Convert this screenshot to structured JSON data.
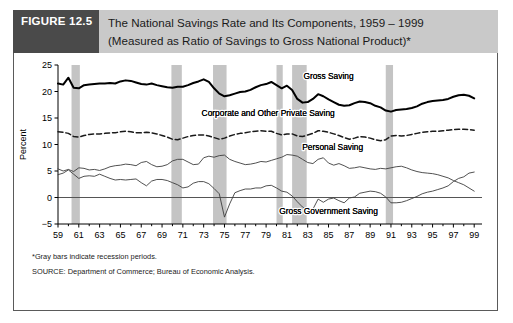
{
  "figure": {
    "tag": "FIGURE 12.5",
    "title_line1": "The National Savings Rate and Its Components, 1959 – 1999",
    "title_line2": "(Measured as Ratio of Savings to Gross National Product)*",
    "note_star": "*Gray bars indicate recession periods.",
    "note_source": "SOURCE: Department of Commerce; Bureau of Economic Analysis.",
    "colors": {
      "tag_background": "#4a4a4a",
      "tag_text": "#ffffff",
      "title_background": "#c9c9c9",
      "border": "#5a5a5a",
      "recession_bar": "#c4c4c4",
      "gross_saving_line": "#000000",
      "thin_line": "#4d4d4d"
    }
  },
  "chart_data": {
    "type": "line",
    "title": "The National Savings Rate and Its Components, 1959 – 1999",
    "xlabel": "",
    "ylabel": "Percent",
    "xlim": [
      1959,
      1999.75
    ],
    "ylim": [
      -5,
      25
    ],
    "yticks": [
      -5,
      0,
      5,
      10,
      15,
      20,
      25
    ],
    "xticks": [
      59,
      61,
      63,
      65,
      67,
      69,
      71,
      73,
      75,
      77,
      79,
      81,
      83,
      85,
      87,
      89,
      91,
      93,
      95,
      97,
      99
    ],
    "xtick_labels": [
      "59",
      "61",
      "63",
      "65",
      "67",
      "69",
      "71",
      "73",
      "75",
      "77",
      "79",
      "81",
      "83",
      "85",
      "87",
      "89",
      "91",
      "93",
      "95",
      "97",
      "99"
    ],
    "grid": false,
    "legend_position": "inline-annotations",
    "zero_line": 0,
    "recession_bands": [
      {
        "start": 1960.3,
        "end": 1961.1
      },
      {
        "start": 1969.9,
        "end": 1970.9
      },
      {
        "start": 1973.9,
        "end": 1975.2
      },
      {
        "start": 1980.0,
        "end": 1980.6
      },
      {
        "start": 1981.5,
        "end": 1982.9
      },
      {
        "start": 1990.5,
        "end": 1991.2
      }
    ],
    "annotations": [
      {
        "text": "Gross Saving",
        "x": 1985.0,
        "y": 22.3
      },
      {
        "text": "Corporate and Other Private Saving",
        "x": 1979.2,
        "y": 15.4
      },
      {
        "text": "Personal Saving",
        "x": 1985.4,
        "y": 8.9
      },
      {
        "text": "Gross Government Saving",
        "x": 1985.0,
        "y": -3.2
      }
    ],
    "x": [
      1959,
      1959.5,
      1960,
      1960.5,
      1961,
      1961.5,
      1962,
      1962.5,
      1963,
      1963.5,
      1964,
      1964.5,
      1965,
      1965.5,
      1966,
      1966.5,
      1967,
      1967.5,
      1968,
      1968.5,
      1969,
      1969.5,
      1970,
      1970.5,
      1971,
      1971.5,
      1972,
      1972.5,
      1973,
      1973.5,
      1974,
      1974.5,
      1975,
      1975.5,
      1976,
      1976.5,
      1977,
      1977.5,
      1978,
      1978.5,
      1979,
      1979.5,
      1980,
      1980.5,
      1981,
      1981.5,
      1982,
      1982.5,
      1983,
      1983.5,
      1984,
      1984.5,
      1985,
      1985.5,
      1986,
      1986.5,
      1987,
      1987.5,
      1988,
      1988.5,
      1989,
      1989.5,
      1990,
      1990.5,
      1991,
      1991.5,
      1992,
      1992.5,
      1993,
      1993.5,
      1994,
      1994.5,
      1995,
      1995.5,
      1996,
      1996.5,
      1997,
      1997.5,
      1998,
      1998.5,
      1999
    ],
    "series": [
      {
        "name": "Gross Saving",
        "style": "solid-thick",
        "values": [
          21.5,
          21.3,
          22.6,
          20.7,
          20.6,
          21.2,
          21.3,
          21.4,
          21.5,
          21.5,
          21.6,
          21.5,
          21.9,
          22.1,
          22.0,
          21.7,
          21.4,
          21.3,
          21.5,
          21.2,
          21.0,
          20.8,
          20.7,
          20.9,
          20.9,
          21.2,
          21.6,
          21.9,
          22.3,
          21.8,
          20.6,
          19.6,
          19.1,
          19.3,
          19.6,
          19.9,
          20.0,
          20.3,
          20.8,
          21.2,
          21.4,
          21.8,
          21.2,
          20.6,
          21.1,
          20.3,
          18.6,
          17.9,
          18.0,
          18.6,
          19.5,
          19.1,
          18.5,
          18.0,
          17.5,
          17.3,
          17.4,
          17.8,
          18.1,
          18.0,
          17.8,
          17.3,
          17.0,
          16.4,
          16.2,
          16.5,
          16.6,
          16.7,
          16.9,
          17.2,
          17.7,
          18.0,
          18.2,
          18.3,
          18.4,
          18.6,
          19.0,
          19.3,
          19.4,
          19.2,
          18.7
        ],
        "description": "Total gross national saving, thick black line"
      },
      {
        "name": "Corporate and Other Private Saving",
        "style": "dashed",
        "values": [
          12.4,
          12.3,
          12.1,
          11.5,
          11.4,
          11.7,
          11.9,
          12.0,
          12.0,
          12.1,
          12.2,
          12.2,
          12.4,
          12.5,
          12.4,
          12.2,
          12.2,
          12.3,
          12.2,
          12.0,
          11.7,
          11.4,
          11.0,
          10.9,
          11.2,
          11.5,
          11.7,
          11.8,
          11.8,
          11.6,
          11.3,
          11.0,
          11.2,
          11.6,
          11.9,
          12.1,
          12.2,
          12.4,
          12.5,
          12.6,
          12.5,
          12.5,
          12.1,
          11.8,
          12.0,
          12.0,
          11.6,
          11.5,
          11.8,
          12.1,
          12.6,
          12.5,
          12.3,
          12.0,
          11.7,
          11.3,
          11.0,
          11.2,
          11.5,
          11.4,
          11.2,
          10.9,
          10.7,
          10.9,
          11.6,
          11.7,
          11.6,
          11.7,
          11.9,
          12.1,
          12.3,
          12.4,
          12.5,
          12.5,
          12.6,
          12.7,
          12.8,
          12.9,
          12.9,
          12.8,
          12.7
        ],
        "description": "Corporate and other private saving, dashed line"
      },
      {
        "name": "Personal Saving",
        "style": "solid-thin",
        "values": [
          5.4,
          5.0,
          5.3,
          4.9,
          5.6,
          5.5,
          5.2,
          5.3,
          5.1,
          5.4,
          5.8,
          6.0,
          6.1,
          6.3,
          6.2,
          6.0,
          6.6,
          6.8,
          6.2,
          5.8,
          5.9,
          6.2,
          6.9,
          7.2,
          7.2,
          6.7,
          6.2,
          6.3,
          7.5,
          7.8,
          7.6,
          7.9,
          8.0,
          7.2,
          6.8,
          6.5,
          6.2,
          6.3,
          6.5,
          6.8,
          6.7,
          7.0,
          7.3,
          7.6,
          8.1,
          8.0,
          7.8,
          7.2,
          6.6,
          6.4,
          7.2,
          7.5,
          6.5,
          6.1,
          6.4,
          6.0,
          5.5,
          5.6,
          5.8,
          5.6,
          5.4,
          5.3,
          5.5,
          5.4,
          5.6,
          5.8,
          5.9,
          5.6,
          5.2,
          4.9,
          4.7,
          4.6,
          4.5,
          4.3,
          4.0,
          3.7,
          3.2,
          2.8,
          2.4,
          1.8,
          1.2
        ],
        "description": "Personal saving, thin line"
      },
      {
        "name": "Gross Government Saving",
        "style": "solid-thin",
        "values": [
          4.3,
          4.6,
          5.2,
          4.4,
          3.6,
          4.0,
          4.1,
          4.0,
          4.4,
          4.0,
          3.6,
          3.3,
          3.4,
          3.3,
          3.4,
          3.5,
          2.8,
          2.2,
          3.1,
          3.4,
          3.4,
          3.2,
          2.8,
          2.4,
          1.8,
          2.0,
          2.7,
          3.0,
          3.0,
          2.6,
          1.7,
          0.7,
          -3.7,
          -1.2,
          0.9,
          1.3,
          1.6,
          1.6,
          1.8,
          1.8,
          2.2,
          2.3,
          1.8,
          1.2,
          1.0,
          0.3,
          -0.8,
          -1.8,
          -2.4,
          -2.2,
          -0.3,
          -0.9,
          -0.3,
          -0.1,
          -0.6,
          -1.0,
          -0.1,
          0.1,
          0.8,
          1.0,
          1.2,
          1.1,
          0.8,
          0.1,
          -1.0,
          -1.0,
          -0.9,
          -0.6,
          -0.2,
          0.2,
          0.7,
          1.0,
          1.2,
          1.5,
          1.8,
          2.2,
          3.0,
          3.6,
          3.9,
          4.6,
          4.8
        ],
        "description": "Gross government saving, thin line"
      }
    ]
  }
}
